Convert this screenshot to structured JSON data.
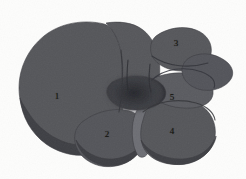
{
  "figure": {
    "background_color": "#fdfdfc",
    "dimensions": {
      "width": 246,
      "height": 179
    }
  },
  "palette": {
    "organ_fill": "#55565a",
    "organ_fill_light": "#63646a",
    "organ_shadow": "#3e3f44",
    "organ_deep_shadow": "#303136",
    "hilum_dark": "#2b2c31",
    "gallbladder_fill": "#6d6e74",
    "outline": "#3a3b40",
    "label_color": "#15140f"
  },
  "labels": [
    {
      "id": "label-1",
      "text": "1",
      "x": 57,
      "y": 96,
      "region": "left-lobe"
    },
    {
      "id": "label-2",
      "text": "2",
      "x": 107,
      "y": 134,
      "region": "quadrate-lobe"
    },
    {
      "id": "label-3",
      "text": "3",
      "x": 176,
      "y": 43,
      "region": "superior-right-lobe"
    },
    {
      "id": "label-4",
      "text": "4",
      "x": 172,
      "y": 131,
      "region": "right-lobe"
    },
    {
      "id": "label-5",
      "text": "5",
      "x": 172,
      "y": 97,
      "region": "caudate-lobe"
    }
  ],
  "regions": [
    {
      "id": "left-lobe",
      "name": "left-lobe",
      "label": "1",
      "fill": "#55565a",
      "path": "M 104 24 C 84 19, 60 23, 44 36 C 28 49, 19 68, 19 88 C 19 107, 27 124, 43 138 C 58 151, 78 157, 95 153 C 108 150, 116 142, 120 131 C 124 118, 122 104, 124 92 C 126 79, 124 62, 120 48 C 117 36, 112 26, 104 24 Z"
    },
    {
      "id": "left-lobe-shadow",
      "name": "left-lobe-inferior-shadow",
      "label": "",
      "fill": "#3e3f44",
      "path": "M 20 98 C 22 117, 31 133, 46 144 C 62 155, 81 158, 96 153 C 108 149, 115 141, 119 131 C 110 140, 96 146, 80 145 C 59 144, 39 130, 28 112 C 24 106, 21 101, 20 98 Z"
    },
    {
      "id": "middle-lobe",
      "name": "middle-lobe-left-medial",
      "label": "",
      "fill": "#56575b",
      "path": "M 106 23 C 118 21, 133 22, 143 30 C 152 37, 157 48, 159 60 C 161 73, 159 85, 154 95 C 148 106, 139 111, 131 108 C 124 105, 120 95, 122 82 C 124 66, 122 46, 114 33 C 111 28, 108 25, 106 23 Z"
    },
    {
      "id": "quadrate-lobe",
      "name": "quadrate-lobe",
      "label": "2",
      "fill": "#54555a",
      "path": "M 85 120 C 96 112, 112 108, 126 110 C 137 112, 144 119, 145 130 C 146 142, 141 153, 131 160 C 119 168, 102 169, 90 162 C 79 156, 73 145, 75 134 C 76 128, 80 123, 85 120 Z"
    },
    {
      "id": "quadrate-lobe-shadow",
      "name": "quadrate-lobe-shadow",
      "label": "",
      "fill": "#3d3e43",
      "path": "M 76 140 C 79 152, 89 162, 102 165 C 116 168, 131 163, 139 152 C 142 148, 144 143, 145 139 C 139 150, 127 158, 113 159 C 98 160, 83 152, 76 140 Z"
    },
    {
      "id": "gallbladder",
      "name": "gallbladder",
      "label": "",
      "fill": "#6d6e74",
      "path": "M 141 107 C 145 107, 149 113, 151 123 C 153 134, 152 146, 148 153 C 145 158, 140 159, 137 154 C 133 147, 131 134, 133 122 C 135 112, 138 107, 141 107 Z"
    },
    {
      "id": "right-lobe",
      "name": "right-lobe",
      "label": "4",
      "fill": "#55565a",
      "path": "M 152 102 C 166 97, 186 97, 199 104 C 211 111, 217 124, 215 137 C 213 150, 203 159, 189 163 C 173 167, 156 163, 147 153 C 140 145, 139 132, 143 120 C 145 112, 148 106, 152 102 Z"
    },
    {
      "id": "right-lobe-shadow",
      "name": "right-lobe-inferior-shadow",
      "label": "",
      "fill": "#3e3f44",
      "path": "M 141 140 C 145 153, 157 162, 172 164 C 190 167, 207 158, 214 143 C 215 141, 216 138, 216 136 C 211 150, 197 159, 181 159 C 163 159, 147 151, 141 140 Z"
    },
    {
      "id": "caudate-lobe",
      "name": "caudate-lobe",
      "label": "5",
      "fill": "#5a5b60",
      "path": "M 154 78 C 166 73, 182 71, 196 75 C 207 78, 214 85, 213 94 C 212 102, 204 107, 192 108 C 177 109, 161 105, 153 97 C 148 92, 148 82, 154 78 Z"
    },
    {
      "id": "superior-right-lobe",
      "name": "superior-right-lobe",
      "label": "3",
      "fill": "#56575b",
      "path": "M 156 36 C 167 28, 183 25, 196 30 C 207 34, 213 44, 211 54 C 209 64, 199 70, 186 71 C 171 72, 157 66, 152 56 C 149 48, 151 40, 156 36 Z"
    },
    {
      "id": "right-wing",
      "name": "right-lateral-wing",
      "label": "",
      "fill": "#53545a",
      "path": "M 196 55 C 207 52, 219 55, 228 63 C 233 68, 234 74, 231 79 C 226 87, 214 92, 202 90 C 191 88, 183 81, 182 72 C 181 63, 188 57, 196 55 Z"
    },
    {
      "id": "hilum",
      "name": "porta-hepatis-hilum",
      "label": "",
      "fill": "#2d2e33",
      "path": "M 112 82 C 122 76, 138 74, 151 78 C 163 82, 169 91, 164 99 C 158 108, 141 112, 126 109 C 113 106, 105 97, 107 89 C 108 86, 110 84, 112 82 Z"
    }
  ],
  "fissures": [
    {
      "id": "fissure-central",
      "name": "falciform-fissure",
      "stroke": "#2a2b30",
      "path": "M 128 60 C 127 70, 126 80, 128 90"
    },
    {
      "id": "fissure-right",
      "name": "right-sagittal-fissure",
      "stroke": "#2e2f34",
      "path": "M 150 64 C 149 74, 148 83, 151 92"
    },
    {
      "id": "fissure-caudate-arc",
      "name": "caudate-lobe-arc",
      "stroke": "#32333a",
      "path": "M 152 80 C 164 68, 186 66, 202 72 C 212 76, 216 82, 214 88"
    },
    {
      "id": "fissure-right-lower",
      "name": "right-lobe-upper-arc",
      "stroke": "#333438",
      "path": "M 143 112 C 156 101, 178 98, 196 103 C 207 106, 214 113, 215 120"
    },
    {
      "id": "fissure-left",
      "name": "left-lobe-medial-groove",
      "stroke": "#34353a",
      "path": "M 121 50 C 123 70, 123 92, 119 112"
    },
    {
      "id": "fissure-superior-right",
      "name": "superior-right-lobe-groove",
      "stroke": "#313238",
      "path": "M 152 56 C 166 66, 188 69, 208 63"
    }
  ]
}
